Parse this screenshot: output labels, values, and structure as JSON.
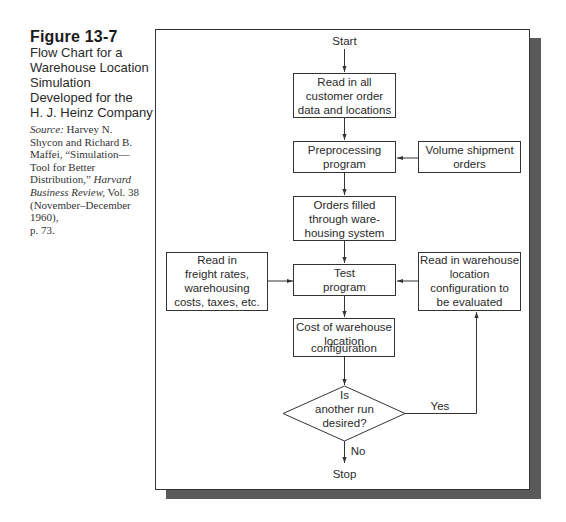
{
  "caption": {
    "figure_number": "Figure 13-7",
    "title_lines": [
      "Flow Chart for a",
      "Warehouse Location",
      "Simulation",
      "Developed for the",
      "H. J. Heinz Company"
    ],
    "source_label": "Source:",
    "source_lines": [
      " Harvey N.",
      "Shycon and Richard B.",
      "Maffei, “Simulation—",
      "Tool for Better",
      "Distribution,” ",
      "Business Review,",
      " Vol. 38",
      "(November–December",
      "1960),",
      "p. 73."
    ],
    "source_journal_1": "Harvard",
    "source_journal_2": "Business Review,"
  },
  "flowchart": {
    "start": "Start",
    "stop": "Stop",
    "nodes": {
      "read_orders": [
        "Read in all",
        "customer order",
        "data and locations"
      ],
      "preprocessing": [
        "Preprocessing",
        "program"
      ],
      "volume_shipment": [
        "Volume shipment",
        "orders"
      ],
      "orders_filled": [
        "Orders filled",
        "through ware-",
        "housing system"
      ],
      "freight_rates": [
        "Read in",
        "freight rates,",
        "warehousing",
        "costs, taxes, etc."
      ],
      "test_program": [
        "Test",
        "program"
      ],
      "warehouse_config": [
        "Read in warehouse",
        "location",
        "configuration to",
        "be evaluated"
      ],
      "cost": [
        "Cost of warehouse",
        "location",
        "configuration"
      ],
      "decision": [
        "Is",
        "another run",
        "desired?"
      ]
    },
    "labels": {
      "yes": "Yes",
      "no": "No"
    },
    "colors": {
      "line": "#333333",
      "shadow": "#5a5a5a",
      "text": "#2a2a2a"
    }
  }
}
